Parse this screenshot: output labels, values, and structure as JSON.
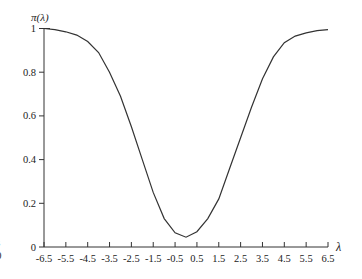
{
  "chart_data": {
    "type": "line",
    "title": "",
    "xlabel": "λ",
    "ylabel": "π(λ)",
    "xlim": [
      -6.5,
      6.5
    ],
    "ylim": [
      0,
      1
    ],
    "grid": false,
    "legend": null,
    "x_ticks": [
      -6.5,
      -5.5,
      -4.5,
      -3.5,
      -2.5,
      -1.5,
      -0.5,
      0.5,
      1.5,
      2.5,
      3.5,
      4.5,
      5.5,
      6.5
    ],
    "x_tick_labels": [
      "-6.5",
      "-5.5",
      "-4.5",
      "-3.5",
      "-2.5",
      "-1.5",
      "-0.5",
      "0.5",
      "1.5",
      "2.5",
      "3.5",
      "4.5",
      "5.5",
      "6.5"
    ],
    "y_ticks": [
      0,
      0.2,
      0.4,
      0.6,
      0.8,
      1
    ],
    "y_tick_labels": [
      "0",
      "0.2",
      "0.4",
      "0.6",
      "0.8",
      "1"
    ],
    "series": [
      {
        "name": "power function π(λ)",
        "color": "#333333",
        "x": [
          -6.5,
          -6.0,
          -5.5,
          -5.0,
          -4.5,
          -4.0,
          -3.5,
          -3.0,
          -2.5,
          -2.0,
          -1.5,
          -1.0,
          -0.5,
          0.0,
          0.5,
          1.0,
          1.5,
          2.0,
          2.5,
          3.0,
          3.5,
          4.0,
          4.5,
          5.0,
          5.5,
          6.0,
          6.5
        ],
        "y": [
          1.0,
          0.995,
          0.985,
          0.97,
          0.94,
          0.89,
          0.8,
          0.69,
          0.55,
          0.4,
          0.25,
          0.13,
          0.065,
          0.045,
          0.07,
          0.13,
          0.22,
          0.36,
          0.5,
          0.64,
          0.77,
          0.87,
          0.935,
          0.965,
          0.98,
          0.99,
          0.995
        ]
      }
    ]
  },
  "edge_text_fragments": [
    "l",
    "f",
    "s",
    "0",
    "."
  ]
}
